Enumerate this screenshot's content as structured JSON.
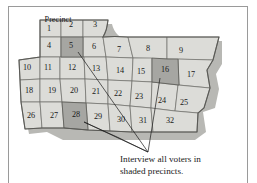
{
  "figure": {
    "title_label": "Precinct",
    "title_number": "1",
    "caption_line1": "Interview all voters in",
    "caption_line2": "shaded precincts.",
    "colors": {
      "cell_light": "#dcdcd8",
      "cell_shaded": "#a6a6a2",
      "cell_stroke": "#6e6e6a",
      "map_outline": "#5a5a56",
      "map_shadow": "#b8b8b4",
      "leader_line": "#1a1a1a",
      "frame": "#9a9a9a",
      "text": "#1a1a1a",
      "background": "#ffffff"
    },
    "shaded_precincts": [
      "5",
      "16",
      "28"
    ],
    "precincts": [
      {
        "id": "1",
        "label": "1",
        "x": 49,
        "y": 29,
        "shaded": false
      },
      {
        "id": "2",
        "label": "2",
        "x": 71,
        "y": 25,
        "shaded": false
      },
      {
        "id": "3",
        "label": "3",
        "x": 95,
        "y": 25,
        "shaded": false
      },
      {
        "id": "4",
        "label": "4",
        "x": 49,
        "y": 46,
        "shaded": false
      },
      {
        "id": "5",
        "label": "5",
        "x": 71,
        "y": 46,
        "shaded": true
      },
      {
        "id": "6",
        "label": "6",
        "x": 94,
        "y": 47,
        "shaded": false
      },
      {
        "id": "7",
        "label": "7",
        "x": 119,
        "y": 50,
        "shaded": false
      },
      {
        "id": "8",
        "label": "8",
        "x": 148,
        "y": 49,
        "shaded": false
      },
      {
        "id": "9",
        "label": "9",
        "x": 181,
        "y": 51,
        "shaded": false
      },
      {
        "id": "10",
        "label": "10",
        "x": 27,
        "y": 68,
        "shaded": false
      },
      {
        "id": "11",
        "label": "11",
        "x": 48,
        "y": 68,
        "shaded": false
      },
      {
        "id": "12",
        "label": "12",
        "x": 72,
        "y": 68,
        "shaded": false
      },
      {
        "id": "13",
        "label": "13",
        "x": 96,
        "y": 69,
        "shaded": false
      },
      {
        "id": "14",
        "label": "14",
        "x": 120,
        "y": 71,
        "shaded": false
      },
      {
        "id": "15",
        "label": "15",
        "x": 141,
        "y": 72,
        "shaded": false
      },
      {
        "id": "16",
        "label": "16",
        "x": 165,
        "y": 70,
        "shaded": true
      },
      {
        "id": "17",
        "label": "17",
        "x": 191,
        "y": 75,
        "shaded": false
      },
      {
        "id": "18",
        "label": "18",
        "x": 29,
        "y": 91,
        "shaded": false
      },
      {
        "id": "19",
        "label": "19",
        "x": 52,
        "y": 91,
        "shaded": false
      },
      {
        "id": "20",
        "label": "20",
        "x": 74,
        "y": 91,
        "shaded": false
      },
      {
        "id": "21",
        "label": "21",
        "x": 96,
        "y": 92,
        "shaded": false
      },
      {
        "id": "22",
        "label": "22",
        "x": 118,
        "y": 94,
        "shaded": false
      },
      {
        "id": "23",
        "label": "23",
        "x": 139,
        "y": 97,
        "shaded": false
      },
      {
        "id": "24",
        "label": "24",
        "x": 162,
        "y": 101,
        "shaded": false
      },
      {
        "id": "25",
        "label": "25",
        "x": 184,
        "y": 103,
        "shaded": false
      },
      {
        "id": "26",
        "label": "26",
        "x": 31,
        "y": 116,
        "shaded": false
      },
      {
        "id": "27",
        "label": "27",
        "x": 54,
        "y": 116,
        "shaded": false
      },
      {
        "id": "28",
        "label": "28",
        "x": 76,
        "y": 115,
        "shaded": true
      },
      {
        "id": "29",
        "label": "29",
        "x": 98,
        "y": 117,
        "shaded": false
      },
      {
        "id": "30",
        "label": "30",
        "x": 121,
        "y": 120,
        "shaded": false
      },
      {
        "id": "31",
        "label": "31",
        "x": 143,
        "y": 121,
        "shaded": false
      },
      {
        "id": "32",
        "label": "32",
        "x": 170,
        "y": 121,
        "shaded": false
      }
    ],
    "leader_lines": [
      {
        "from_precinct": "5",
        "x1": 78,
        "y1": 52,
        "x2": 148,
        "y2": 152
      },
      {
        "from_precinct": "16",
        "x1": 160,
        "y1": 78,
        "x2": 148,
        "y2": 152
      },
      {
        "from_precinct": "28",
        "x1": 84,
        "y1": 122,
        "x2": 148,
        "y2": 152
      }
    ]
  }
}
